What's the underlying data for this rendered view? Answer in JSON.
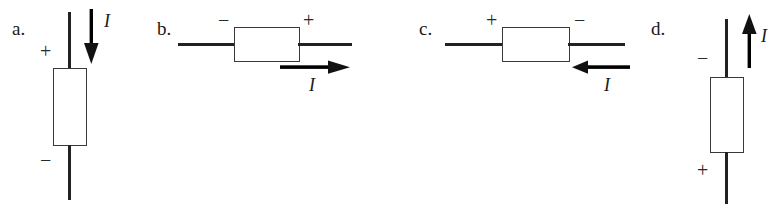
{
  "figure": {
    "type": "circuit-diagram-set",
    "background_color": "#ffffff",
    "ink_color": "#1a1a1a",
    "current_symbol": "I",
    "plus_symbol": "+",
    "minus_symbol": "−",
    "panels": [
      {
        "id": "a",
        "label": "a.",
        "orientation": "vertical",
        "top_terminal_sign": "+",
        "bottom_terminal_sign": "−",
        "current_symbol": "I",
        "current_direction": "down",
        "current_arrow_side": "right"
      },
      {
        "id": "b",
        "label": "b.",
        "orientation": "horizontal",
        "left_terminal_sign": "−",
        "right_terminal_sign": "+",
        "current_symbol": "I",
        "current_direction": "right",
        "current_arrow_side": "below-right"
      },
      {
        "id": "c",
        "label": "c.",
        "orientation": "horizontal",
        "left_terminal_sign": "+",
        "right_terminal_sign": "−",
        "current_symbol": "I",
        "current_direction": "left",
        "current_arrow_side": "below-right"
      },
      {
        "id": "d",
        "label": "d.",
        "orientation": "vertical",
        "top_terminal_sign": "−",
        "bottom_terminal_sign": "+",
        "current_symbol": "I",
        "current_direction": "up",
        "current_arrow_side": "right"
      }
    ]
  }
}
